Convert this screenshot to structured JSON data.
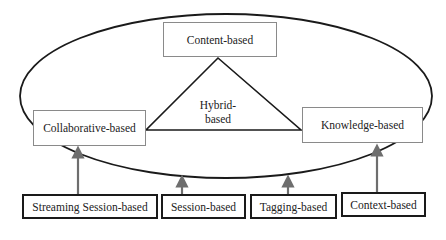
{
  "diagram": {
    "type": "recommender-system-taxonomy",
    "core": {
      "container": "ellipse",
      "nodes": [
        {
          "id": "content",
          "label": "Content-based"
        },
        {
          "id": "collaborative",
          "label": "Collaborative-based"
        },
        {
          "id": "knowledge",
          "label": "Knowledge-based"
        }
      ],
      "center": {
        "id": "hybrid",
        "label_line1": "Hybrid-",
        "label_line2": "based",
        "shape": "triangle"
      }
    },
    "external": [
      {
        "id": "streaming",
        "label": "Streaming Session-based",
        "arrow_to": "ellipse"
      },
      {
        "id": "session",
        "label": "Session-based",
        "arrow_to": "ellipse"
      },
      {
        "id": "tagging",
        "label": "Tagging-based",
        "arrow_to": "ellipse"
      },
      {
        "id": "context",
        "label": "Context-based",
        "arrow_to": "ellipse"
      }
    ],
    "colors": {
      "ellipse_stroke": "#1a1a1a",
      "triangle_stroke": "#1a1a1a",
      "inner_box_border": "#8a8a8a",
      "outer_box_border": "#1a1a1a",
      "arrow": "#6e6e6e"
    }
  }
}
